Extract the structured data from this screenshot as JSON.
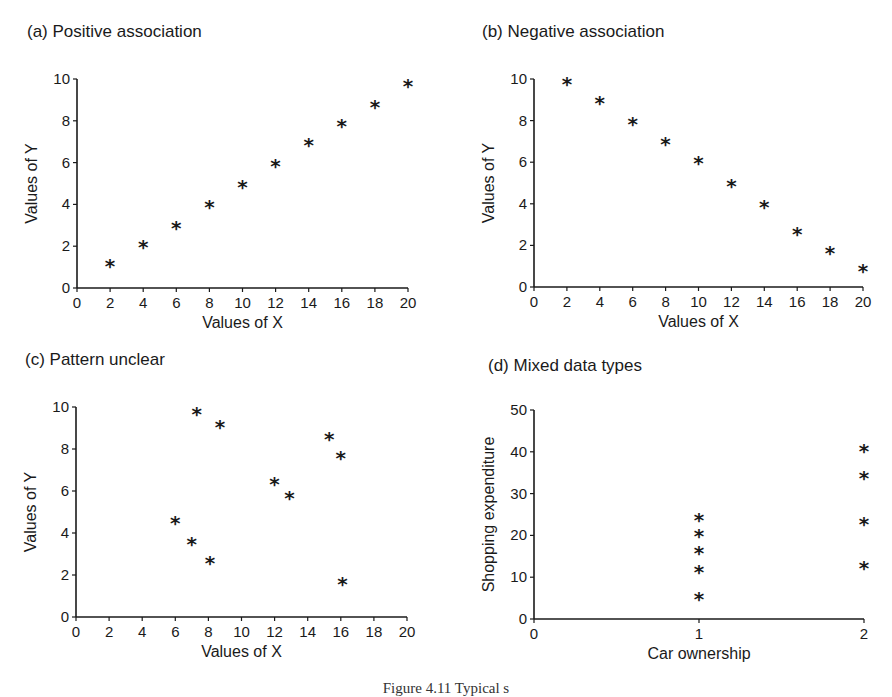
{
  "caption": "Figure 4.11 Typical s",
  "chart_data": [
    {
      "id": "a",
      "type": "scatter",
      "title": "(a)  Positive association",
      "xlabel": "Values of X",
      "ylabel": "Values of Y",
      "xlim": [
        0,
        20
      ],
      "ylim": [
        0,
        10
      ],
      "xticks": [
        0,
        2,
        4,
        6,
        8,
        10,
        12,
        14,
        16,
        18,
        20
      ],
      "yticks": [
        0,
        2,
        4,
        6,
        8,
        10
      ],
      "marker": "*",
      "grid": false,
      "points": [
        [
          2,
          1.2
        ],
        [
          4,
          2.1
        ],
        [
          6,
          3.0
        ],
        [
          8,
          4.0
        ],
        [
          10,
          5.0
        ],
        [
          12,
          6.0
        ],
        [
          14,
          7.0
        ],
        [
          16,
          7.9
        ],
        [
          18,
          8.8
        ],
        [
          20,
          9.8
        ]
      ]
    },
    {
      "id": "b",
      "type": "scatter",
      "title": "(b)  Negative association",
      "xlabel": "Values of X",
      "ylabel": "Values of Y",
      "xlim": [
        0,
        20
      ],
      "ylim": [
        0,
        10
      ],
      "xticks": [
        0,
        2,
        4,
        6,
        8,
        10,
        12,
        14,
        16,
        18,
        20
      ],
      "yticks": [
        0,
        2,
        4,
        6,
        8,
        10
      ],
      "marker": "*",
      "grid": false,
      "points": [
        [
          2,
          9.9
        ],
        [
          4,
          9.0
        ],
        [
          6,
          8.0
        ],
        [
          8,
          7.0
        ],
        [
          10,
          6.1
        ],
        [
          12,
          5.0
        ],
        [
          14,
          4.0
        ],
        [
          16,
          2.7
        ],
        [
          18,
          1.8
        ],
        [
          20,
          0.9
        ]
      ]
    },
    {
      "id": "c",
      "type": "scatter",
      "title": "(c)  Pattern unclear",
      "xlabel": "Values of X",
      "ylabel": "Values of Y",
      "xlim": [
        0,
        20
      ],
      "ylim": [
        0,
        10
      ],
      "xticks": [
        0,
        2,
        4,
        6,
        8,
        10,
        12,
        14,
        16,
        18,
        20
      ],
      "yticks": [
        0,
        2,
        4,
        6,
        8,
        10
      ],
      "marker": "*",
      "grid": false,
      "points": [
        [
          7.3,
          9.8
        ],
        [
          8.7,
          9.2
        ],
        [
          15.3,
          8.6
        ],
        [
          16.0,
          7.7
        ],
        [
          12.0,
          6.5
        ],
        [
          12.9,
          5.8
        ],
        [
          6.0,
          4.6
        ],
        [
          7.0,
          3.6
        ],
        [
          8.1,
          2.7
        ],
        [
          16.1,
          1.7
        ]
      ]
    },
    {
      "id": "d",
      "type": "scatter",
      "title": "(d)  Mixed data types",
      "xlabel": "Car ownership",
      "ylabel": "Shopping expenditure",
      "xlim": [
        0,
        2
      ],
      "ylim": [
        0,
        50
      ],
      "xticks": [
        0,
        1,
        2
      ],
      "yticks": [
        0,
        10,
        20,
        30,
        40,
        50
      ],
      "marker": "*",
      "grid": false,
      "points": [
        [
          1,
          24.5
        ],
        [
          1,
          20.5
        ],
        [
          1,
          16.5
        ],
        [
          1,
          12.0
        ],
        [
          1,
          5.5
        ],
        [
          2,
          41.0
        ],
        [
          2,
          34.5
        ],
        [
          2,
          23.5
        ],
        [
          2,
          13.0
        ]
      ]
    }
  ]
}
